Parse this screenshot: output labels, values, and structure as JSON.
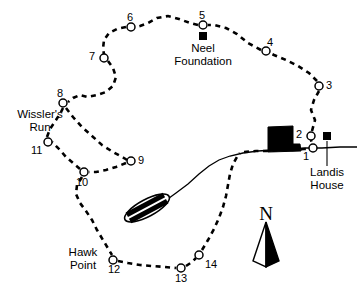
{
  "map": {
    "title": "Trail Map",
    "colors": {
      "ink": "#000000",
      "paper": "#ffffff",
      "trail": "#000000",
      "road": "#000000",
      "building": "#000000"
    },
    "trail_style": "dashed-loop",
    "stops": [
      {
        "id": "1",
        "label": "1",
        "cx": 313,
        "cy": 148,
        "lx": 308,
        "ly": 152
      },
      {
        "id": "2",
        "label": "2",
        "cx": 311,
        "cy": 136,
        "lx": 298,
        "ly": 130
      },
      {
        "id": "3",
        "label": "3",
        "cx": 319,
        "cy": 86,
        "lx": 325,
        "ly": 80
      },
      {
        "id": "4",
        "label": "4",
        "cx": 266,
        "cy": 51,
        "lx": 269,
        "ly": 38
      },
      {
        "id": "5",
        "label": "5",
        "cx": 203,
        "cy": 25,
        "lx": 199,
        "ly": 11
      },
      {
        "id": "6",
        "label": "6",
        "cx": 131,
        "cy": 27,
        "lx": 128,
        "ly": 13
      },
      {
        "id": "7",
        "label": "7",
        "cx": 104,
        "cy": 58,
        "lx": 91,
        "ly": 52
      },
      {
        "id": "8",
        "label": "8",
        "cx": 63,
        "cy": 103,
        "lx": 58,
        "ly": 89
      },
      {
        "id": "9",
        "label": "9",
        "cx": 131,
        "cy": 161,
        "lx": 137,
        "ly": 155
      },
      {
        "id": "10",
        "label": "10",
        "cx": 84,
        "cy": 172,
        "lx": 76,
        "ly": 177
      },
      {
        "id": "11",
        "label": "11",
        "cx": 48,
        "cy": 142,
        "lx": 33,
        "ly": 147
      },
      {
        "id": "12",
        "label": "12",
        "cx": 113,
        "cy": 260,
        "lx": 107,
        "ly": 265
      },
      {
        "id": "13",
        "label": "13",
        "cx": 181,
        "cy": 268,
        "lx": 175,
        "ly": 273
      },
      {
        "id": "14",
        "label": "14",
        "cx": 199,
        "cy": 255,
        "lx": 204,
        "ly": 259
      }
    ],
    "places": [
      {
        "name": "neel-foundation",
        "line1": "Neel",
        "line2": "Foundation",
        "text_x": 203,
        "text_y": 44,
        "marker_x": 203,
        "marker_y": 36,
        "marker_type": "filled-square",
        "has_leader": false
      },
      {
        "name": "landis-house",
        "line1": "Landis",
        "line2": "House",
        "text_x": 325,
        "text_y": 170,
        "marker_x": 327,
        "marker_y": 136,
        "marker_type": "filled-square",
        "has_leader": true,
        "leader_x": 327,
        "leader_y1": 141,
        "leader_y2": 166
      }
    ],
    "named_features": [
      {
        "name": "wisslers-run",
        "line1": "Wissler's",
        "line2": "Run",
        "text_x": 39,
        "text_y": 113,
        "align": "center"
      },
      {
        "name": "hawk-point",
        "line1": "Hawk",
        "line2": "Point",
        "text_x": 82,
        "text_y": 248,
        "align": "center"
      }
    ],
    "compass": {
      "label": "N",
      "label_x": 265,
      "label_y": 212,
      "arrow_tip_x": 266,
      "arrow_tip_y": 221,
      "arrow_base_y": 267
    },
    "road": {
      "name": "main-road",
      "path": "M 357 147 L 316 148 L 280 149 L 250 152 L 226 156 L 210 162 L 198 170 L 182 185 L 168 196 L 155 205"
    },
    "pond": {
      "name": "pond-feature",
      "cx": 147,
      "cy": 208,
      "rx": 24,
      "ry": 8,
      "rotation": -28
    },
    "building": {
      "name": "landis-house-building",
      "points": "268,127 293,126 293,144 299,144 300,151 268,152"
    }
  }
}
